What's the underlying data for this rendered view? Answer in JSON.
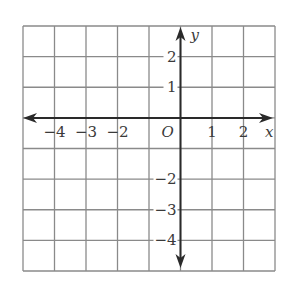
{
  "chart_data": {
    "type": "coordinate-plane",
    "title": "",
    "xlabel": "x",
    "ylabel": "y",
    "origin_label": "O",
    "xlim": [
      -5,
      3
    ],
    "ylim": [
      -5,
      3
    ],
    "grid": true,
    "grid_step": 1,
    "x_tick_labels": [
      {
        "value": -4,
        "text": "−4"
      },
      {
        "value": -3,
        "text": "−3"
      },
      {
        "value": -2,
        "text": "−2"
      },
      {
        "value": 1,
        "text": "1"
      },
      {
        "value": 2,
        "text": "2"
      }
    ],
    "y_tick_labels": [
      {
        "value": 2,
        "text": "2"
      },
      {
        "value": 1,
        "text": "1"
      },
      {
        "value": -2,
        "text": "−2"
      },
      {
        "value": -3,
        "text": "−3"
      },
      {
        "value": -4,
        "text": "−4"
      }
    ],
    "series": []
  },
  "colors": {
    "grid": "#8a8a8a",
    "axis": "#2a2a2a",
    "text": "#3a3a3a",
    "background": "#ffffff"
  }
}
